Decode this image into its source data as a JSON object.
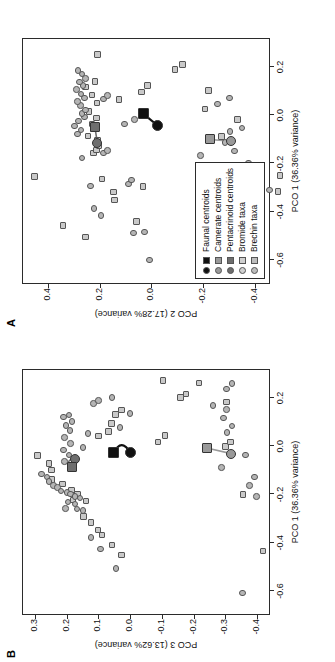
{
  "figure": {
    "panels": [
      {
        "letter": "B",
        "id": "panel-b",
        "xlabel": "PCO 1 (36.36% variance)",
        "ylabel": "PCO 3 (13.62% variance)",
        "xticks": [
          "-0.6",
          "-0.4",
          "-0.2",
          "0.0",
          "0.2"
        ],
        "yticks": [
          "-0.4",
          "-0.3",
          "-0.2",
          "-0.1",
          "0.0",
          "0.1",
          "0.2",
          "0.3"
        ]
      },
      {
        "letter": "A",
        "id": "panel-a",
        "xlabel": "PCO 1 (36.36% variance)",
        "ylabel": "PCO 2 (17.28% variance)",
        "xticks": [
          "-0.6",
          "-0.4",
          "-0.2",
          "0.0",
          "0.2"
        ],
        "yticks": [
          "-0.4",
          "-0.2",
          "0.0",
          "0.2",
          "0.4"
        ]
      }
    ]
  },
  "legend": {
    "title": "",
    "items": [
      {
        "label": "Faunal centroids",
        "circle": "#111111",
        "square": "#111111"
      },
      {
        "label": "Camerate centroids",
        "circle": "#999999",
        "square": "#999999"
      },
      {
        "label": "Pentacrinoid centroids",
        "circle": "#6e6e6e",
        "square": "#6e6e6e"
      },
      {
        "label": "Bromide taxa",
        "circle": "#d0d0d0",
        "square": "#d0d0d0"
      },
      {
        "label": "Brechin taxa",
        "circle": "#bdbdbd",
        "square": "#bdbdbd"
      }
    ]
  },
  "colors": {
    "faunal": "#111111",
    "camerate": "#999999",
    "pentacrinoid": "#6e6e6e",
    "bromide": "#c9c9c9",
    "brechin": "#b5b5b5",
    "outline": "#555555",
    "axis": "#2b2b2b"
  },
  "chart_data": [
    {
      "type": "scatter",
      "title": "B",
      "xlabel": "PCO 1 (36.36% variance)",
      "ylabel": "PCO 3 (13.62% variance)",
      "xlim": [
        -0.7,
        0.32
      ],
      "ylim": [
        -0.44,
        0.34
      ],
      "xticks": [
        -0.6,
        -0.4,
        -0.2,
        0.0,
        0.2
      ],
      "yticks": [
        -0.4,
        -0.3,
        -0.2,
        -0.1,
        0.0,
        0.1,
        0.2,
        0.3
      ],
      "grid": false,
      "legend_position": "none",
      "series": [
        {
          "name": "Bromide taxa",
          "marker": "square",
          "color": "#c9c9c9",
          "points": [
            [
              -0.043,
              0.295
            ],
            [
              -0.075,
              0.258
            ],
            [
              -0.102,
              0.25
            ],
            [
              -0.143,
              0.249
            ],
            [
              -0.16,
              0.215
            ],
            [
              -0.185,
              0.188
            ],
            [
              -0.205,
              0.168
            ],
            [
              -0.228,
              0.183
            ],
            [
              -0.232,
              0.142
            ],
            [
              -0.295,
              0.15
            ],
            [
              -0.321,
              0.126
            ],
            [
              -0.352,
              0.104
            ],
            [
              -0.372,
              0.092
            ],
            [
              -0.413,
              0.06
            ],
            [
              -0.455,
              0.03
            ],
            [
              0.038,
              0.102
            ],
            [
              0.056,
              0.071
            ],
            [
              0.089,
              0.062
            ],
            [
              0.127,
              0.049
            ],
            [
              0.146,
              0.03
            ],
            [
              0.014,
              -0.085
            ],
            [
              0.04,
              -0.107
            ],
            [
              0.198,
              -0.155
            ],
            [
              0.212,
              -0.173
            ],
            [
              0.258,
              -0.213
            ],
            [
              -0.005,
              -0.297
            ],
            [
              0.013,
              -0.312
            ],
            [
              0.178,
              -0.3
            ],
            [
              -0.205,
              -0.352
            ],
            [
              -0.438,
              -0.415
            ],
            [
              0.268,
              -0.1
            ]
          ]
        },
        {
          "name": "Brechin taxa",
          "marker": "circle",
          "color": "#b5b5b5",
          "points": [
            [
              -0.119,
              0.282
            ],
            [
              -0.131,
              0.265
            ],
            [
              -0.151,
              0.258
            ],
            [
              -0.168,
              0.244
            ],
            [
              -0.176,
              0.231
            ],
            [
              -0.191,
              0.22
            ],
            [
              -0.197,
              0.202
            ],
            [
              -0.203,
              0.19
            ],
            [
              -0.212,
              0.176
            ],
            [
              -0.219,
              0.16
            ],
            [
              -0.236,
              0.198
            ],
            [
              -0.244,
              0.176
            ],
            [
              -0.263,
              0.206
            ],
            [
              -0.265,
              0.17
            ],
            [
              -0.271,
              0.152
            ],
            [
              -0.068,
              0.21
            ],
            [
              -0.04,
              0.196
            ],
            [
              -0.021,
              0.212
            ],
            [
              0.006,
              0.19
            ],
            [
              0.031,
              0.21
            ],
            [
              0.061,
              0.192
            ],
            [
              0.082,
              0.205
            ],
            [
              0.098,
              0.186
            ],
            [
              0.116,
              0.212
            ],
            [
              0.125,
              0.196
            ],
            [
              -0.01,
              0.152
            ],
            [
              0.049,
              0.135
            ],
            [
              0.172,
              0.118
            ],
            [
              0.186,
              0.103
            ],
            [
              0.073,
              0.035
            ],
            [
              0.131,
              0.003
            ],
            [
              -0.383,
              0.126
            ],
            [
              -0.43,
              0.096
            ],
            [
              -0.512,
              0.048
            ],
            [
              0.165,
              -0.258
            ],
            [
              0.112,
              -0.29
            ],
            [
              0.147,
              -0.3
            ],
            [
              0.052,
              -0.302
            ],
            [
              0.079,
              -0.318
            ],
            [
              -0.092,
              -0.285
            ],
            [
              -0.04,
              -0.36
            ],
            [
              -0.168,
              -0.372
            ],
            [
              -0.131,
              -0.388
            ],
            [
              -0.213,
              -0.395
            ],
            [
              0.232,
              -0.3
            ],
            [
              0.255,
              -0.318
            ],
            [
              -0.613,
              -0.35
            ],
            [
              0.197,
              0.06
            ]
          ]
        },
        {
          "name": "Camerate centroids",
          "marker": "circle",
          "color": "#999999",
          "points": [
            [
              -0.035,
              -0.315
            ]
          ]
        },
        {
          "name": "Camerate centroid target",
          "marker": "square",
          "color": "#999999",
          "points": [
            [
              -0.012,
              -0.238
            ]
          ]
        },
        {
          "name": "Pentacrinoid centroids",
          "marker": "circle",
          "color": "#6e6e6e",
          "points": [
            [
              -0.056,
              0.176
            ]
          ]
        },
        {
          "name": "Pentacrinoid centroid target",
          "marker": "square",
          "color": "#6e6e6e",
          "points": [
            [
              -0.092,
              0.186
            ]
          ]
        },
        {
          "name": "Faunal centroids",
          "marker": "circle",
          "color": "#111111",
          "points": [
            [
              -0.03,
              0.003
            ]
          ]
        },
        {
          "name": "Faunal centroid target",
          "marker": "square",
          "color": "#111111",
          "points": [
            [
              -0.032,
              0.055
            ]
          ]
        }
      ],
      "connectors": [
        {
          "name": "faunal-shift",
          "from": [
            -0.03,
            0.003
          ],
          "to": [
            -0.032,
            0.055
          ],
          "curved": true,
          "color": "#111111"
        },
        {
          "name": "pentacrinoid-shift",
          "from": [
            -0.056,
            0.176
          ],
          "to": [
            -0.092,
            0.186
          ],
          "curved": true,
          "color": "#6e6e6e"
        },
        {
          "name": "camerate-shift",
          "from": [
            -0.035,
            -0.315
          ],
          "to": [
            -0.012,
            -0.238
          ],
          "curved": false,
          "color": "#999999"
        }
      ]
    },
    {
      "type": "scatter",
      "title": "A",
      "xlabel": "PCO 1 (36.36% variance)",
      "ylabel": "PCO 2 (17.28% variance)",
      "xlim": [
        -0.7,
        0.32
      ],
      "ylim": [
        -0.46,
        0.5
      ],
      "xticks": [
        -0.6,
        -0.4,
        -0.2,
        0.0,
        0.2
      ],
      "yticks": [
        -0.4,
        -0.2,
        0.0,
        0.2,
        0.4
      ],
      "grid": false,
      "legend_position": "lower-left",
      "series": [
        {
          "name": "Bromide taxa",
          "marker": "square",
          "color": "#c9c9c9",
          "points": [
            [
              -0.258,
              0.455
            ],
            [
              -0.462,
              0.345
            ],
            [
              -0.51,
              0.258
            ],
            [
              -0.446,
              0.06
            ],
            [
              -0.355,
              0.145
            ],
            [
              -0.322,
              0.15
            ],
            [
              -0.3,
              0.035
            ],
            [
              -0.268,
              0.195
            ],
            [
              -0.162,
              0.228
            ],
            [
              -0.148,
              0.215
            ],
            [
              -0.13,
              0.205
            ],
            [
              -0.108,
              0.212
            ],
            [
              -0.09,
              0.248
            ],
            [
              -0.062,
              0.23
            ],
            [
              -0.04,
              0.232
            ],
            [
              -0.016,
              0.216
            ],
            [
              0.012,
              0.245
            ],
            [
              0.046,
              0.213
            ],
            [
              0.08,
              0.232
            ],
            [
              0.112,
              0.258
            ],
            [
              0.136,
              0.222
            ],
            [
              0.06,
              0.128
            ],
            [
              0.092,
              0.042
            ],
            [
              0.118,
              0.018
            ],
            [
              0.186,
              -0.088
            ],
            [
              0.205,
              -0.118
            ],
            [
              0.022,
              -0.205
            ],
            [
              0.098,
              -0.218
            ],
            [
              -0.092,
              -0.268
            ],
            [
              -0.022,
              -0.33
            ],
            [
              -0.32,
              -0.488
            ],
            [
              -0.255,
              -0.495
            ],
            [
              0.248,
              0.212
            ]
          ]
        },
        {
          "name": "Brechin taxa",
          "marker": "circle",
          "color": "#b5b5b5",
          "points": [
            [
              -0.605,
              0.01
            ],
            [
              -0.492,
              0.072
            ],
            [
              -0.488,
              0.03
            ],
            [
              -0.42,
              0.198
            ],
            [
              -0.392,
              0.225
            ],
            [
              -0.298,
              0.238
            ],
            [
              -0.29,
              0.092
            ],
            [
              -0.272,
              0.08
            ],
            [
              -0.182,
              0.272
            ],
            [
              -0.162,
              0.188
            ],
            [
              -0.15,
              0.172
            ],
            [
              -0.082,
              0.29
            ],
            [
              -0.066,
              0.276
            ],
            [
              -0.05,
              0.3
            ],
            [
              -0.028,
              0.285
            ],
            [
              -0.012,
              0.262
            ],
            [
              0.002,
              0.272
            ],
            [
              0.018,
              0.258
            ],
            [
              0.036,
              0.278
            ],
            [
              0.052,
              0.29
            ],
            [
              0.068,
              0.262
            ],
            [
              0.084,
              0.275
            ],
            [
              0.102,
              0.292
            ],
            [
              0.118,
              0.268
            ],
            [
              0.134,
              0.282
            ],
            [
              0.148,
              0.258
            ],
            [
              0.166,
              0.272
            ],
            [
              0.182,
              0.288
            ],
            [
              0.062,
              0.188
            ],
            [
              0.078,
              0.172
            ],
            [
              -0.04,
              0.108
            ],
            [
              -0.022,
              0.068
            ],
            [
              -0.118,
              -0.282
            ],
            [
              -0.152,
              -0.318
            ],
            [
              -0.072,
              -0.302
            ],
            [
              -0.058,
              -0.348
            ],
            [
              -0.202,
              -0.372
            ],
            [
              -0.238,
              -0.398
            ],
            [
              -0.29,
              -0.425
            ],
            [
              -0.315,
              -0.455
            ],
            [
              0.042,
              -0.252
            ],
            [
              0.068,
              -0.3
            ],
            [
              -0.172,
              -0.188
            ]
          ]
        },
        {
          "name": "Camerate centroids",
          "marker": "circle",
          "color": "#999999",
          "points": [
            [
              -0.112,
              -0.305
            ]
          ]
        },
        {
          "name": "Camerate centroid target",
          "marker": "square",
          "color": "#999999",
          "points": [
            [
              -0.105,
              -0.225
            ]
          ]
        },
        {
          "name": "Pentacrinoid centroids",
          "marker": "circle",
          "color": "#6e6e6e",
          "points": [
            [
              -0.12,
              0.212
            ]
          ]
        },
        {
          "name": "Pentacrinoid centroid target",
          "marker": "square",
          "color": "#6e6e6e",
          "points": [
            [
              -0.052,
              0.222
            ]
          ]
        },
        {
          "name": "Faunal centroids",
          "marker": "circle",
          "color": "#111111",
          "points": [
            [
              -0.048,
              -0.022
            ]
          ]
        },
        {
          "name": "Faunal centroid target",
          "marker": "square",
          "color": "#111111",
          "points": [
            [
              0.002,
              0.035
            ]
          ]
        }
      ],
      "connectors": [
        {
          "name": "faunal-shift",
          "from": [
            -0.048,
            -0.022
          ],
          "to": [
            0.002,
            0.035
          ],
          "curved": false,
          "color": "#111111"
        },
        {
          "name": "pentacrinoid-shift",
          "from": [
            -0.12,
            0.212
          ],
          "to": [
            -0.052,
            0.222
          ],
          "curved": false,
          "color": "#6e6e6e"
        },
        {
          "name": "camerate-shift",
          "from": [
            -0.112,
            -0.305
          ],
          "to": [
            -0.105,
            -0.225
          ],
          "curved": false,
          "color": "#999999"
        }
      ]
    }
  ]
}
